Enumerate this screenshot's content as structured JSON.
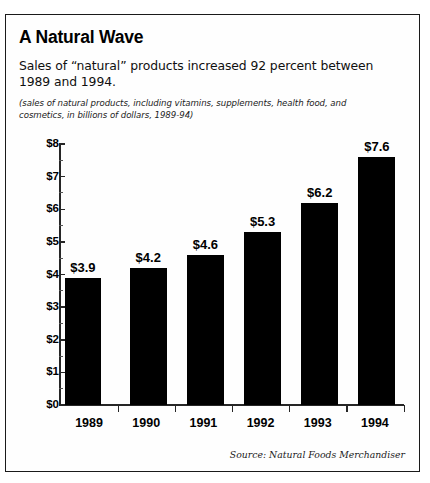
{
  "card": {
    "title": "A Natural Wave",
    "subtitle": "Sales of “natural” products increased 92 percent between 1989 and 1994.",
    "note": "(sales of natural products, including vitamins, supplements, health food, and cosmetics, in billions of dollars, 1989-94)",
    "source": "Source: Natural Foods Merchandiser"
  },
  "chart_data": {
    "type": "bar",
    "title": "A Natural Wave",
    "subtitle": "Sales of “natural” products increased 92 percent between 1989 and 1994.",
    "note": "(sales of natural products, including vitamins, supplements, health food, and cosmetics, in billions of dollars, 1989-94)",
    "source": "Source: Natural Foods Merchandiser",
    "categories": [
      "1989",
      "1990",
      "1991",
      "1992",
      "1993",
      "1994"
    ],
    "values": [
      3.9,
      4.2,
      4.6,
      5.3,
      6.2,
      7.6
    ],
    "value_labels": [
      "$3.9",
      "$4.2",
      "$4.6",
      "$5.3",
      "$6.2",
      "$7.6"
    ],
    "xlabel": "",
    "ylabel": "",
    "ylim": [
      0,
      8
    ],
    "ytick_labels": [
      "$0",
      "$1",
      "$2",
      "$3",
      "$4",
      "$5",
      "$6",
      "$7",
      "$8"
    ],
    "ytick_values": [
      0,
      1,
      2,
      3,
      4,
      5,
      6,
      7,
      8
    ],
    "yminor_values": [
      0.5,
      1.5,
      2.5,
      3.5,
      4.5,
      5.5,
      6.5,
      7.5
    ],
    "grid": false,
    "legend": false,
    "bar_color": "#000000",
    "axis_color": "#262626",
    "background": "#fefefe"
  }
}
